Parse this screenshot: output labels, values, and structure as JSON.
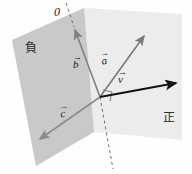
{
  "figure": {
    "regions": [
      {
        "id": "negative-region",
        "label": "負",
        "meaning": "negative side",
        "fill": "#c9c9c9",
        "polygon": "12,40 84,8 94,132 36,166"
      },
      {
        "id": "positive-region",
        "label": "正",
        "meaning": "positive side",
        "fill": "#ededed",
        "polygon": "84,8 182,14 182,140 94,132"
      }
    ],
    "vectors": [
      {
        "name": "b",
        "label": "b",
        "accent": "→",
        "color": "#808080",
        "x1": 100,
        "y1": 97,
        "x2": 74,
        "y2": 27,
        "description": "normal vector pointing up along the boundary plane"
      },
      {
        "name": "a",
        "label": "a",
        "accent": "→",
        "color": "#7a7a7a",
        "x1": 100,
        "y1": 97,
        "x2": 146,
        "y2": 33,
        "description": "vector pointing up and to the right"
      },
      {
        "name": "v",
        "label": "v",
        "accent": "→",
        "color": "#111111",
        "x1": 100,
        "y1": 97,
        "x2": 179,
        "y2": 82,
        "description": "resultant vector pointing right"
      },
      {
        "name": "c",
        "label": "c",
        "accent": "→",
        "color": "#8a8a8a",
        "x1": 100,
        "y1": 97,
        "x2": 37,
        "y2": 141,
        "description": "vector pointing down and to the left"
      }
    ],
    "dashed_line": {
      "name": "boundary-axis",
      "color": "#6f6f6f",
      "segments": [
        {
          "x1": 66,
          "y1": 3,
          "x2": 74,
          "y2": 27
        },
        {
          "x1": 100,
          "y1": 97,
          "x2": 113,
          "y2": 169
        }
      ]
    },
    "right_angle_marker": {
      "name": "right-angle-marker",
      "x": 100,
      "y": 97,
      "size": 9,
      "color": "#6f6f6f"
    },
    "origin_marker": {
      "label": "0"
    }
  }
}
